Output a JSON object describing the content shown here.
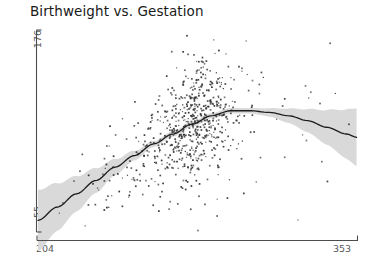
{
  "chart_data": {
    "type": "scatter",
    "title": "Birthweight vs. Gestation",
    "xlabel": "",
    "ylabel": "",
    "grid": false,
    "legend": null,
    "xlim": [
      204,
      353
    ],
    "ylim": [
      55,
      176
    ],
    "xticks": [
      204,
      353
    ],
    "yticks": [
      55,
      176
    ],
    "xtick_labels": [
      "204",
      "353"
    ],
    "ytick_labels": [
      "55",
      "176"
    ],
    "series": [
      {
        "name": "observations",
        "type": "scatter",
        "marker": "square",
        "marker_size": 1.6,
        "color": "#333333",
        "n_points": 700,
        "description": "Birthweight plotted against gestation days; dense cluster near gestation 275-290 with birthweight 95-135, diffuse tail toward shorter gestation"
      },
      {
        "name": "smoothed-fit",
        "type": "line",
        "color": "#1c1c1c",
        "width": 1.3,
        "description": "Loess fit rising steeply from gestation 204 to about 290, peaking near birthweight 128, then declining toward gestation 353",
        "points": [
          {
            "x": 204,
            "y": 62
          },
          {
            "x": 213,
            "y": 70
          },
          {
            "x": 222,
            "y": 78
          },
          {
            "x": 231,
            "y": 86
          },
          {
            "x": 240,
            "y": 94
          },
          {
            "x": 249,
            "y": 101
          },
          {
            "x": 258,
            "y": 108
          },
          {
            "x": 267,
            "y": 114
          },
          {
            "x": 276,
            "y": 120
          },
          {
            "x": 285,
            "y": 125
          },
          {
            "x": 294,
            "y": 128
          },
          {
            "x": 303,
            "y": 128
          },
          {
            "x": 312,
            "y": 127
          },
          {
            "x": 321,
            "y": 125
          },
          {
            "x": 330,
            "y": 122
          },
          {
            "x": 339,
            "y": 118
          },
          {
            "x": 348,
            "y": 114
          },
          {
            "x": 353,
            "y": 112
          }
        ]
      },
      {
        "name": "confidence-band",
        "type": "area",
        "color": "#d9d9d9",
        "description": "Confidence ribbon around the fit, very wide at the left edge, narrowest near gestation 280, flaring again at the right edge"
      }
    ]
  },
  "axes": {
    "y_top_label": "176",
    "y_bottom_label": "55",
    "x_left_label": "204",
    "x_right_label": "353"
  },
  "title": {
    "text": "Birthweight vs. Gestation"
  },
  "colors": {
    "background": "#ffffff",
    "axis": "#4d4d4d",
    "point": "#333333",
    "fit_line": "#1c1c1c",
    "band": "#d9d9d9",
    "title_text": "#1a1a1a",
    "tick_text": "#5a5a5a"
  }
}
